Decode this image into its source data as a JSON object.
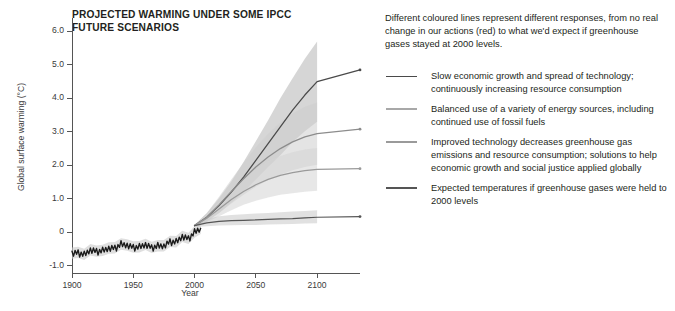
{
  "chart_data": {
    "type": "line",
    "title": "PROJECTED WARMING UNDER SOME IPCC FUTURE SCENARIOS",
    "xlabel": "Year",
    "ylabel": "Global surface warming (°C)",
    "xlim": [
      1900,
      2135
    ],
    "ylim": [
      -1.2,
      6.4
    ],
    "grid": false,
    "xticks": [
      1900,
      1950,
      2000,
      2050,
      2100
    ],
    "xtick_labels": [
      "1900",
      "1950",
      "2000",
      "2050",
      "2100"
    ],
    "yticks": [
      -1.0,
      0,
      1.0,
      2.0,
      3.0,
      4.0,
      5.0,
      6.0
    ],
    "ytick_labels": [
      "-1.0",
      "0",
      "1.0",
      "2.0",
      "3.0",
      "4.0",
      "5.0",
      "6.0"
    ],
    "legend_position": "right",
    "series": [
      {
        "name": "observed",
        "label": "Observed historical global surface warming",
        "color": "#1a1a1a",
        "band_color": "#c9c9c9",
        "x": [
          1900,
          1905,
          1910,
          1915,
          1920,
          1925,
          1930,
          1935,
          1940,
          1945,
          1950,
          1955,
          1960,
          1965,
          1970,
          1975,
          1980,
          1985,
          1990,
          1995,
          2000,
          2005
        ],
        "values": [
          -0.62,
          -0.6,
          -0.66,
          -0.52,
          -0.56,
          -0.54,
          -0.47,
          -0.46,
          -0.35,
          -0.38,
          -0.44,
          -0.43,
          -0.36,
          -0.45,
          -0.4,
          -0.4,
          -0.27,
          -0.28,
          -0.12,
          -0.18,
          0.01,
          0.12
        ]
      },
      {
        "name": "a2-high",
        "label": "Slow economic growth and spread of technology; continuously increasing resource consumption",
        "color": "#4a4a4a",
        "band_color": "#b4b4b4",
        "x": [
          2000,
          2010,
          2020,
          2030,
          2040,
          2050,
          2060,
          2070,
          2080,
          2090,
          2100,
          2135
        ],
        "values": [
          0.2,
          0.45,
          0.8,
          1.2,
          1.65,
          2.15,
          2.65,
          3.15,
          3.65,
          4.1,
          4.5,
          4.85
        ],
        "band_low": [
          0.18,
          0.33,
          0.58,
          0.88,
          1.2,
          1.58,
          1.95,
          2.3,
          2.7,
          3.02,
          3.3,
          null
        ],
        "band_high": [
          0.22,
          0.57,
          1.02,
          1.52,
          2.1,
          2.72,
          3.35,
          4.0,
          4.6,
          5.18,
          5.7,
          null
        ]
      },
      {
        "name": "a1b-mid",
        "label": "Balanced use of a variety of energy sources, including continued use of fossil fuels",
        "color": "#8c8c8c",
        "band_color": "#cdcdcd",
        "x": [
          2000,
          2010,
          2020,
          2030,
          2040,
          2050,
          2060,
          2070,
          2080,
          2090,
          2100,
          2135
        ],
        "values": [
          0.2,
          0.45,
          0.82,
          1.22,
          1.6,
          1.95,
          2.25,
          2.5,
          2.7,
          2.85,
          2.95,
          3.08
        ],
        "band_low": [
          0.18,
          0.32,
          0.58,
          0.86,
          1.12,
          1.36,
          1.56,
          1.72,
          1.85,
          1.95,
          2.02,
          null
        ],
        "band_high": [
          0.22,
          0.58,
          1.06,
          1.58,
          2.08,
          2.54,
          2.94,
          3.28,
          3.55,
          3.75,
          3.88,
          null
        ]
      },
      {
        "name": "b1-low",
        "label": "Improved technology decreases greenhouse gas emissions and resource consumption; solutions to help economic growth and social justice applied globally",
        "color": "#9a9a9a",
        "band_color": "#d4d4d4",
        "x": [
          2000,
          2010,
          2020,
          2030,
          2040,
          2050,
          2060,
          2070,
          2080,
          2090,
          2100,
          2135
        ],
        "values": [
          0.2,
          0.42,
          0.7,
          0.98,
          1.22,
          1.42,
          1.58,
          1.7,
          1.78,
          1.84,
          1.88,
          1.9
        ],
        "band_low": [
          0.18,
          0.3,
          0.48,
          0.66,
          0.82,
          0.94,
          1.04,
          1.12,
          1.17,
          1.21,
          1.24,
          null
        ],
        "band_high": [
          0.22,
          0.54,
          0.92,
          1.3,
          1.62,
          1.9,
          2.12,
          2.28,
          2.39,
          2.47,
          2.52,
          null
        ]
      },
      {
        "name": "constant-2000",
        "label": "Expected temperatures if greenhouse gases were held to 2000 levels",
        "color": "#555555",
        "band_color": "#c9c9c9",
        "x": [
          2000,
          2010,
          2020,
          2030,
          2040,
          2050,
          2060,
          2070,
          2080,
          2090,
          2100,
          2135
        ],
        "values": [
          0.2,
          0.28,
          0.33,
          0.35,
          0.36,
          0.37,
          0.39,
          0.4,
          0.41,
          0.43,
          0.45,
          0.47
        ],
        "band_low": [
          0.16,
          0.18,
          0.2,
          0.21,
          0.22,
          0.22,
          0.23,
          0.24,
          0.25,
          0.26,
          0.27,
          null
        ],
        "band_high": [
          0.24,
          0.4,
          0.48,
          0.52,
          0.54,
          0.56,
          0.58,
          0.6,
          0.62,
          0.64,
          0.66,
          null
        ]
      }
    ]
  },
  "chart": {
    "title": "PROJECTED WARMING UNDER SOME IPCC FUTURE SCENARIOS",
    "title_line1": "PROJECTED WARMING UNDER SOME IPCC",
    "title_line2": "FUTURE SCENARIOS",
    "ylabel": "Global surface warming (°C)",
    "xlabel": "Year"
  },
  "legend": {
    "intro": "Different coloured lines represent different responses, from no real change in our actions (red) to what we'd expect if greenhouse gases stayed at 2000 levels.",
    "items": [
      {
        "swatch_color": "#4a4a4a",
        "text": "Slow economic growth and spread of technology; continuously increasing resource consumption"
      },
      {
        "swatch_color": "#a8a8a8",
        "text": "Balanced use of a variety of energy sources, including continued use of fossil fuels"
      },
      {
        "swatch_color": "#9a9a9a",
        "text": "Improved technology decreases greenhouse gas emissions and resource consumption; solutions to help economic growth and social justice applied globally"
      },
      {
        "swatch_color": "#555555",
        "text": "Expected temperatures if greenhouse gases were held to 2000 levels"
      }
    ]
  },
  "footer": {
    "fragment": ""
  }
}
